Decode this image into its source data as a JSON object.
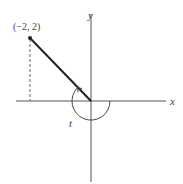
{
  "diagram": {
    "point_label": "(−2, 2)",
    "x_axis_label": "x",
    "y_axis_label": "y",
    "angle_label": "t",
    "point": {
      "x": -2,
      "y": 2
    },
    "angle_direction": "clockwise (negative)",
    "colors": {
      "axes": "#555555",
      "segment": "#222222",
      "dashed": "#666666"
    }
  }
}
